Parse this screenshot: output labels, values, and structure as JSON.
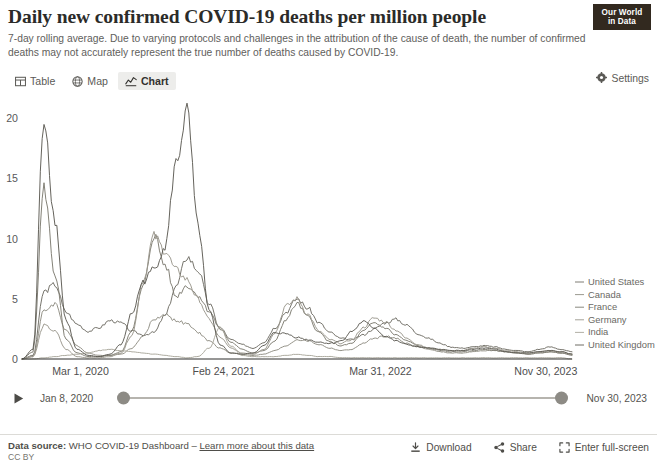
{
  "header": {
    "title": "Daily new confirmed COVID-19 deaths per million people",
    "subtitle": "7-day rolling average. Due to varying protocols and challenges in the attribution of the cause of death, the number of confirmed deaths may not accurately represent the true number of deaths caused by COVID-19.",
    "logo_line1": "Our World",
    "logo_line2": "in Data"
  },
  "tabs": [
    {
      "label": "Table",
      "icon": "table-icon",
      "active": false
    },
    {
      "label": "Map",
      "icon": "globe-icon",
      "active": false
    },
    {
      "label": "Chart",
      "icon": "line-chart-icon",
      "active": true
    }
  ],
  "settings": {
    "label": "Settings",
    "icon": "gear-icon"
  },
  "timeline": {
    "play_icon": "play-icon",
    "start_date": "Jan 8, 2020",
    "end_date": "Nov 30, 2023"
  },
  "footer": {
    "source_prefix": "Data source:",
    "source_name": "WHO COVID-19 Dashboard",
    "separator": "–",
    "learn_more": "Learn more about this data",
    "license": "CC BY",
    "actions": [
      {
        "label": "Download",
        "icon": "download-icon"
      },
      {
        "label": "Share",
        "icon": "share-icon"
      },
      {
        "label": "Enter full-screen",
        "icon": "fullscreen-icon"
      }
    ]
  },
  "chart_data": {
    "type": "line",
    "title": "Daily new confirmed COVID-19 deaths per million people",
    "subtitle": "7-day rolling average",
    "xlabel": "",
    "ylabel": "",
    "ylim": [
      0,
      21
    ],
    "yticks": [
      0,
      5,
      10,
      15,
      20
    ],
    "ytick_labels": [
      "0",
      "5",
      "10",
      "15",
      "20"
    ],
    "xlim": [
      "2020-01-08",
      "2023-11-30"
    ],
    "xticks": [
      "Mar 1, 2020",
      "Feb 24, 2021",
      "Mar 31, 2022",
      "Nov 30, 2023"
    ],
    "xtick_positions": [
      0.055,
      0.31,
      0.595,
      0.895
    ],
    "grid": false,
    "legend_position": "right-inline",
    "line_colors": {
      "United States": "#6f6d64",
      "Canada": "#8f8d83",
      "France": "#7c7a70",
      "Germany": "#9a978c",
      "India": "#a9a69b",
      "United Kingdom": "#5d5b53"
    },
    "series": [
      {
        "name": "United States",
        "x": [
          0.0,
          0.02,
          0.04,
          0.06,
          0.08,
          0.1,
          0.12,
          0.14,
          0.16,
          0.18,
          0.2,
          0.22,
          0.24,
          0.26,
          0.28,
          0.3,
          0.32,
          0.34,
          0.36,
          0.38,
          0.4,
          0.42,
          0.44,
          0.46,
          0.48,
          0.5,
          0.52,
          0.54,
          0.56,
          0.58,
          0.6,
          0.62,
          0.64,
          0.66,
          0.68,
          0.7,
          0.72,
          0.74,
          0.76,
          0.78,
          0.8,
          0.82,
          0.84,
          0.86,
          0.88,
          0.9,
          0.92,
          0.94,
          0.96,
          0.98,
          1.0
        ],
        "values": [
          0.0,
          0.3,
          5.6,
          6.2,
          3.9,
          2.9,
          2.3,
          2.6,
          3.2,
          3.0,
          2.3,
          2.0,
          2.2,
          3.6,
          6.0,
          8.5,
          7.4,
          4.6,
          2.6,
          1.6,
          1.2,
          0.9,
          1.4,
          2.6,
          3.9,
          5.0,
          4.2,
          3.0,
          2.2,
          1.7,
          1.6,
          2.0,
          2.5,
          3.0,
          3.3,
          2.8,
          2.1,
          1.7,
          1.3,
          1.0,
          0.9,
          1.0,
          1.1,
          1.0,
          0.8,
          0.7,
          0.6,
          0.8,
          1.0,
          0.8,
          0.6
        ]
      },
      {
        "name": "Canada",
        "x": [
          0.0,
          0.02,
          0.04,
          0.06,
          0.08,
          0.1,
          0.12,
          0.14,
          0.16,
          0.18,
          0.2,
          0.22,
          0.24,
          0.26,
          0.28,
          0.3,
          0.32,
          0.34,
          0.36,
          0.38,
          0.4,
          0.42,
          0.44,
          0.46,
          0.48,
          0.5,
          0.52,
          0.54,
          0.56,
          0.58,
          0.6,
          0.62,
          0.64,
          0.66,
          0.68,
          0.7,
          0.72,
          0.74,
          0.76,
          0.78,
          0.8,
          0.82,
          0.84,
          0.86,
          0.88,
          0.9,
          0.92,
          0.94,
          0.96,
          0.98,
          1.0
        ],
        "values": [
          0.0,
          0.2,
          4.0,
          4.6,
          2.4,
          1.1,
          0.5,
          0.3,
          0.3,
          0.4,
          0.9,
          1.9,
          3.3,
          3.7,
          3.2,
          2.9,
          2.2,
          1.5,
          0.9,
          0.5,
          0.4,
          0.3,
          0.4,
          0.7,
          1.1,
          1.6,
          1.5,
          1.2,
          0.9,
          0.7,
          0.8,
          1.3,
          1.7,
          1.9,
          1.7,
          1.3,
          1.0,
          0.8,
          0.6,
          0.5,
          0.5,
          0.6,
          0.7,
          0.7,
          0.6,
          0.5,
          0.4,
          0.5,
          0.6,
          0.5,
          0.4
        ]
      },
      {
        "name": "France",
        "x": [
          0.0,
          0.02,
          0.04,
          0.06,
          0.08,
          0.1,
          0.12,
          0.14,
          0.16,
          0.18,
          0.2,
          0.22,
          0.24,
          0.26,
          0.28,
          0.3,
          0.32,
          0.34,
          0.36,
          0.38,
          0.4,
          0.42,
          0.44,
          0.46,
          0.48,
          0.5,
          0.52,
          0.54,
          0.56,
          0.58,
          0.6,
          0.62,
          0.64,
          0.66,
          0.68,
          0.7,
          0.72,
          0.74,
          0.76,
          0.78,
          0.8,
          0.82,
          0.84,
          0.86,
          0.88,
          0.9,
          0.92,
          0.94,
          0.96,
          0.98,
          1.0
        ],
        "values": [
          0.0,
          0.6,
          14.2,
          7.0,
          1.6,
          0.5,
          0.2,
          0.2,
          0.3,
          0.6,
          2.4,
          6.0,
          10.3,
          7.8,
          5.2,
          6.1,
          5.3,
          4.0,
          2.5,
          1.4,
          0.8,
          0.5,
          0.7,
          1.5,
          3.3,
          4.6,
          3.5,
          2.2,
          1.4,
          1.1,
          1.3,
          2.3,
          3.0,
          2.6,
          2.0,
          1.5,
          1.1,
          0.9,
          0.7,
          0.6,
          0.6,
          0.7,
          0.8,
          0.7,
          0.6,
          0.5,
          0.4,
          0.5,
          0.6,
          0.5,
          0.3
        ]
      },
      {
        "name": "Germany",
        "x": [
          0.0,
          0.02,
          0.04,
          0.06,
          0.08,
          0.1,
          0.12,
          0.14,
          0.16,
          0.18,
          0.2,
          0.22,
          0.24,
          0.26,
          0.28,
          0.3,
          0.32,
          0.34,
          0.36,
          0.38,
          0.4,
          0.42,
          0.44,
          0.46,
          0.48,
          0.5,
          0.52,
          0.54,
          0.56,
          0.58,
          0.6,
          0.62,
          0.64,
          0.66,
          0.68,
          0.7,
          0.72,
          0.74,
          0.76,
          0.78,
          0.8,
          0.82,
          0.84,
          0.86,
          0.88,
          0.9,
          0.92,
          0.94,
          0.96,
          0.98,
          1.0
        ],
        "values": [
          0.0,
          0.2,
          2.8,
          2.3,
          0.8,
          0.2,
          0.1,
          0.1,
          0.2,
          0.5,
          2.0,
          6.5,
          10.2,
          9.0,
          7.4,
          6.6,
          5.0,
          3.3,
          1.8,
          0.9,
          0.5,
          0.4,
          0.8,
          2.2,
          4.4,
          5.0,
          3.7,
          2.3,
          1.6,
          1.3,
          1.6,
          2.6,
          3.4,
          3.1,
          2.4,
          1.7,
          1.2,
          0.9,
          0.8,
          0.7,
          0.7,
          0.9,
          1.0,
          0.9,
          0.7,
          0.6,
          0.5,
          0.6,
          0.7,
          0.6,
          0.4
        ]
      },
      {
        "name": "India",
        "x": [
          0.0,
          0.02,
          0.04,
          0.06,
          0.08,
          0.1,
          0.12,
          0.14,
          0.16,
          0.18,
          0.2,
          0.22,
          0.24,
          0.26,
          0.28,
          0.3,
          0.32,
          0.34,
          0.36,
          0.38,
          0.4,
          0.42,
          0.44,
          0.46,
          0.48,
          0.5,
          0.52,
          0.54,
          0.56,
          0.58,
          0.6,
          0.62,
          0.64,
          0.66,
          0.68,
          0.7,
          0.72,
          0.74,
          0.76,
          0.78,
          0.8,
          0.82,
          0.84,
          0.86,
          0.88,
          0.9,
          0.92,
          0.94,
          0.96,
          0.98,
          1.0
        ],
        "values": [
          0.0,
          0.0,
          0.1,
          0.2,
          0.3,
          0.4,
          0.5,
          0.7,
          0.8,
          0.7,
          0.6,
          0.5,
          0.4,
          0.3,
          0.2,
          0.1,
          0.2,
          0.9,
          2.6,
          1.1,
          0.3,
          0.2,
          0.2,
          0.2,
          0.3,
          0.4,
          0.3,
          0.2,
          0.2,
          0.1,
          0.1,
          0.1,
          0.1,
          0.1,
          0.1,
          0.1,
          0.1,
          0.1,
          0.1,
          0.1,
          0.1,
          0.1,
          0.1,
          0.1,
          0.1,
          0.1,
          0.1,
          0.1,
          0.1,
          0.1,
          0.0
        ]
      },
      {
        "name": "United Kingdom",
        "x": [
          0.0,
          0.02,
          0.04,
          0.06,
          0.08,
          0.1,
          0.12,
          0.14,
          0.16,
          0.18,
          0.2,
          0.22,
          0.24,
          0.26,
          0.28,
          0.3,
          0.32,
          0.34,
          0.36,
          0.38,
          0.4,
          0.42,
          0.44,
          0.46,
          0.48,
          0.5,
          0.52,
          0.54,
          0.56,
          0.58,
          0.6,
          0.62,
          0.64,
          0.66,
          0.68,
          0.7,
          0.72,
          0.74,
          0.76,
          0.78,
          0.8,
          0.82,
          0.84,
          0.86,
          0.88,
          0.9,
          0.92,
          0.94,
          0.96,
          0.98,
          1.0
        ],
        "values": [
          0.0,
          0.8,
          20.0,
          11.5,
          3.2,
          0.8,
          0.3,
          0.2,
          0.4,
          1.2,
          3.8,
          6.4,
          7.5,
          9.3,
          16.2,
          20.5,
          11.0,
          4.0,
          1.2,
          0.5,
          0.4,
          0.5,
          1.1,
          2.2,
          2.1,
          1.8,
          1.6,
          1.4,
          1.3,
          1.5,
          2.3,
          3.1,
          2.6,
          1.9,
          1.5,
          1.2,
          1.0,
          0.9,
          0.8,
          0.7,
          0.7,
          0.8,
          0.9,
          0.8,
          0.6,
          0.5,
          0.5,
          0.6,
          0.7,
          0.6,
          0.4
        ]
      }
    ]
  }
}
